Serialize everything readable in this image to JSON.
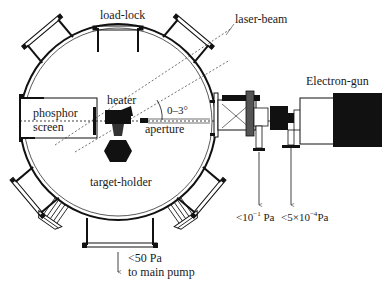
{
  "diagram": {
    "labels": {
      "load_lock": "load-lock",
      "laser_beam": "laser-beam",
      "electron_gun": "Electron-gun",
      "phosphor": "phosphor",
      "screen": "screen",
      "heater": "heater",
      "angle": "0–3°",
      "aperture": "aperture",
      "target_holder": "target-holder",
      "pressure_1": "<10",
      "pressure_1_exp": "−1",
      "pressure_1_unit": " Pa",
      "pressure_2": "<5×10",
      "pressure_2_exp": "−4",
      "pressure_2_unit": "Pa",
      "pump_pressure": "<50 Pa",
      "pump_label": "to main pump"
    },
    "colors": {
      "ink": "#111111",
      "background": "#ffffff"
    }
  }
}
